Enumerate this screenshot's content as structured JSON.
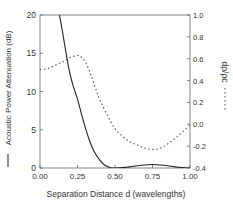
{
  "chart_data": {
    "type": "line",
    "title": "",
    "xlabel": "Separation Distance  d  (wavelengths)",
    "ylabel_left": "Acoustic Power Attenuation (dB)",
    "ylabel_right": "dρ/ρc",
    "xlim": [
      0.0,
      1.0
    ],
    "ylim_left": [
      0,
      20
    ],
    "ylim_right": [
      -0.4,
      1.0
    ],
    "x_ticks": [
      "0.00",
      "0.25",
      "0.50",
      "0.75",
      "1.00"
    ],
    "y_left_ticks": [
      "0",
      "5",
      "10",
      "15",
      "20"
    ],
    "y_right_ticks": [
      "-0.4",
      "-0.2",
      "0.0",
      "0.2",
      "0.4",
      "0.6",
      "0.8",
      "1.0"
    ],
    "grid": false,
    "legend": "inline in axis labels (solid = left axis, dashed = right axis)",
    "series": [
      {
        "name": "Acoustic Power Attenuation (dB)",
        "axis": "left",
        "style": "solid",
        "x": [
          0.13,
          0.15,
          0.18,
          0.2,
          0.22,
          0.25,
          0.28,
          0.3,
          0.33,
          0.36,
          0.4,
          0.43,
          0.46,
          0.48,
          0.5,
          0.55,
          0.6,
          0.65,
          0.7,
          0.75,
          0.8,
          0.85,
          0.9,
          0.95,
          1.0
        ],
        "values": [
          20.0,
          17.8,
          14.3,
          12.3,
          10.8,
          9.0,
          6.8,
          5.4,
          3.6,
          2.2,
          1.0,
          0.4,
          0.1,
          0.0,
          0.0,
          0.05,
          0.15,
          0.3,
          0.4,
          0.45,
          0.4,
          0.3,
          0.15,
          0.05,
          0.0
        ]
      },
      {
        "name": "dρ/ρc",
        "axis": "right",
        "style": "dashed",
        "x": [
          0.0,
          0.05,
          0.1,
          0.15,
          0.2,
          0.25,
          0.28,
          0.31,
          0.34,
          0.37,
          0.4,
          0.45,
          0.5,
          0.55,
          0.6,
          0.65,
          0.7,
          0.75,
          0.8,
          0.85,
          0.9,
          0.95,
          1.0
        ],
        "values": [
          0.5,
          0.51,
          0.54,
          0.57,
          0.61,
          0.63,
          0.61,
          0.55,
          0.45,
          0.33,
          0.22,
          0.08,
          -0.04,
          -0.11,
          -0.16,
          -0.19,
          -0.22,
          -0.23,
          -0.22,
          -0.18,
          -0.13,
          -0.07,
          -0.01
        ]
      }
    ]
  },
  "plot_area": {
    "left": 40,
    "right": 190,
    "top": 15,
    "bottom": 168
  },
  "colors": {
    "solid_line": "#222222",
    "dashed_line": "#555555",
    "frame": "#666666",
    "text": "#333333"
  }
}
